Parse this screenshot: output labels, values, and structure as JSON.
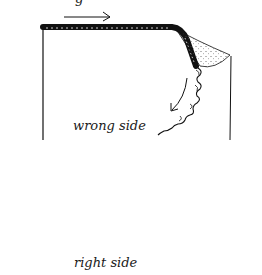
{
  "figure": {
    "type": "sewing-technique-illustration",
    "labels": {
      "top_panel": "wrong side",
      "bottom_panel": "right side",
      "cut_off_top_text": "g"
    },
    "panels": [
      {
        "name": "wrong-side-panel",
        "edge": "top edge rolled with stitching, corner folded back showing dotted right side",
        "arrow": "right-pointing arrow above edge; curved arrow down the side"
      },
      {
        "name": "right-side-panel",
        "edge": "top edge with double row of stitching and loose thread ends",
        "arrow": "right-pointing arrow above edge; looped arrow pointing down at right"
      }
    ],
    "colors": {
      "ink": "#111111",
      "background": "#ffffff",
      "stipple": "#555555"
    }
  }
}
